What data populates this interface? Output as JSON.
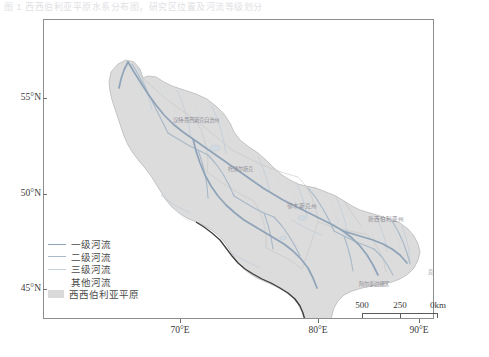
{
  "caption": {
    "text": "图 1  西西伯利亚平原水系分布图，研究区位置及河流等级划分"
  },
  "map": {
    "title": "",
    "projection_note": "",
    "background_color": "#ffffff",
    "frame_color": "#8d8d8d",
    "plain_fill_color": "#dcdcdc",
    "plain_border_color": "#b4b4b4",
    "boundary_color": "#3c3c3c",
    "river_primary_color": "#8fa3b8",
    "river_secondary_color": "#a9b9c9",
    "river_tertiary_color": "#c2cdd8",
    "river_other_color": "#d5dce3"
  },
  "axes": {
    "latitude": [
      {
        "label": "55°N",
        "value": 55,
        "y": 98
      },
      {
        "label": "50°N",
        "value": 50,
        "y": 194
      },
      {
        "label": "45°N",
        "value": 45,
        "y": 289
      }
    ],
    "longitude": [
      {
        "label": "70°E",
        "value": 70,
        "x": 180
      },
      {
        "label": "80°E",
        "value": 80,
        "x": 318
      },
      {
        "label": "90°E",
        "value": 90,
        "x": 419
      }
    ]
  },
  "place_labels": [
    {
      "name": "汉特-曼西斯克自治州",
      "x": 152,
      "y": 100,
      "size": 5.4
    },
    {
      "name": "托博尔斯克",
      "x": 196,
      "y": 148,
      "size": 5.2
    },
    {
      "name": "鄂木斯克州",
      "x": 258,
      "y": 186,
      "size": 5.6
    },
    {
      "name": "新西伯利亚州",
      "x": 342,
      "y": 199,
      "size": 5.6
    },
    {
      "name": "阿尔泰边疆区",
      "x": 330,
      "y": 264,
      "size": 5.4
    },
    {
      "name": "克麦罗沃州",
      "x": 396,
      "y": 251,
      "size": 5.2
    }
  ],
  "legend": {
    "items": [
      {
        "label": "一级河流",
        "type": "line",
        "color": "#8fa3b8",
        "width": 1.7
      },
      {
        "label": "二级河流",
        "type": "line",
        "color": "#a9b9c9",
        "width": 1.2
      },
      {
        "label": "三级河流",
        "type": "line",
        "color": "#c6d0da",
        "width": 0.9
      },
      {
        "label": "其他河流",
        "type": "line",
        "color": "#ffffff",
        "width": 0.7
      },
      {
        "label": "西西伯利亚平原",
        "type": "box",
        "color": "#d9d9d9"
      }
    ]
  },
  "scale_bar": {
    "units": "km",
    "ticks": [
      {
        "label": "500",
        "pos": 0
      },
      {
        "label": "250",
        "pos": 50
      },
      {
        "label": "0km",
        "pos": 100
      }
    ]
  }
}
